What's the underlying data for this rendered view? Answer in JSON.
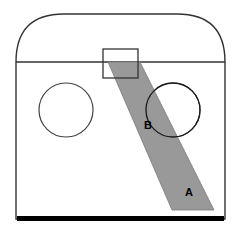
{
  "figure": {
    "background_color": "#ffffff",
    "stroke_color": "#333333",
    "band_fill_color": "#999999",
    "band_stroke_color": "#7a7a7a",
    "base_bar_color": "#000000",
    "label_color": "#000000",
    "width": 240,
    "height": 239
  },
  "labels": {
    "band_lower": "A",
    "band_upper": "B"
  },
  "shapes": {
    "outer_body": {
      "name": "domed-enclosure-outline",
      "left_x": 16,
      "right_x": 225,
      "top_y": 14,
      "bottom_y": 219,
      "corner_radius": 48
    },
    "divider_line": {
      "name": "horizontal-divider",
      "y": 62,
      "x1": 16,
      "x2": 225
    },
    "port_left": {
      "name": "left-circle-port",
      "cx": 66,
      "cy": 110,
      "r": 27
    },
    "port_right": {
      "name": "right-circle-port",
      "cx": 173,
      "cy": 110,
      "r": 27
    },
    "top_box": {
      "name": "top-inlet-box",
      "x": 103,
      "y": 49,
      "width": 35,
      "height": 29
    },
    "band": {
      "name": "diagonal-shaded-band",
      "points": "108,62 140,62 214,210 172,210"
    },
    "base_bar": {
      "name": "base-bar",
      "x": 17,
      "y": 216,
      "width": 207,
      "height": 5
    }
  },
  "label_positions": {
    "A": {
      "x": 189,
      "y": 196
    },
    "B": {
      "x": 148,
      "y": 129
    }
  }
}
